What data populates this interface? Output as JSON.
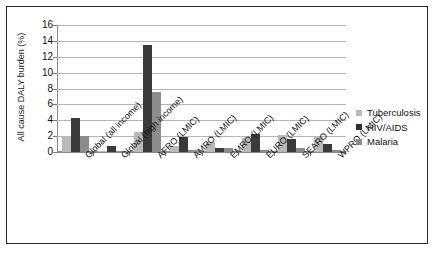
{
  "chart_data": {
    "type": "bar",
    "title": "",
    "xlabel": "",
    "ylabel": "All cause DALY burden (%)",
    "ylim": [
      0,
      16
    ],
    "yticks": [
      0,
      2,
      4,
      6,
      8,
      10,
      12,
      14,
      16
    ],
    "grid": true,
    "legend_position": "right",
    "categories": [
      "Global (all income)",
      "Global (high income)",
      "AFRO (LMIC)",
      "AMRO (LMIC)",
      "EMRO (LMIC)",
      "EURO (LMIC)",
      "SEARO (LMIC)",
      "WPRO (LMIC)"
    ],
    "series": [
      {
        "name": "Tuberculosis",
        "color": "#b9b9b9",
        "values": [
          2.0,
          0.1,
          2.5,
          0.8,
          1.3,
          1.8,
          2.2,
          1.9
        ]
      },
      {
        "name": "HIV/AIDS",
        "color": "#3a3a3a",
        "values": [
          4.3,
          0.75,
          13.5,
          1.9,
          0.5,
          2.3,
          1.6,
          1.0
        ]
      },
      {
        "name": "Malaria",
        "color": "#8c8c8c",
        "values": [
          2.0,
          0.05,
          7.5,
          0.25,
          0.5,
          0.3,
          0.5,
          0.3
        ]
      }
    ]
  },
  "legend": {
    "items": [
      {
        "label": "Tuberculosis",
        "swatch": "tb"
      },
      {
        "label": "HIV/AIDS",
        "swatch": "hiv"
      },
      {
        "label": "Malaria",
        "swatch": "malaria"
      }
    ]
  }
}
